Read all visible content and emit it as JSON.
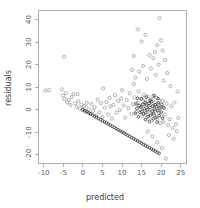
{
  "chart_data": {
    "type": "scatter",
    "title": "",
    "xlabel": "predicted",
    "ylabel": "residuals",
    "xlim": [
      -11.5,
      26.5
    ],
    "ylim": [
      -24,
      44
    ],
    "xticks": [
      -10,
      -5,
      0,
      5,
      10,
      15,
      20,
      25
    ],
    "xtick_labels": [
      "-10",
      "-5",
      "0",
      "5",
      "10",
      "15",
      "20",
      "25"
    ],
    "yticks": [
      -20,
      -10,
      0,
      10,
      20,
      30,
      40
    ],
    "ytick_labels": [
      "-20",
      "-10",
      "0",
      "10",
      "20",
      "30",
      "40"
    ],
    "grid": false,
    "legend": null,
    "marker": "open-circle",
    "marker_size": 1.6,
    "point_color": "#777777",
    "dense_point_color": "#2b2b2b",
    "axis_color": "#9a9a9a",
    "background": "#ffffff",
    "series": [
      {
        "name": "residuals",
        "points": [
          [
            -9.6,
            8.4
          ],
          [
            -8.6,
            8.6
          ],
          [
            -5.4,
            9.0
          ],
          [
            -5.1,
            6.2
          ],
          [
            -4.7,
            4.6
          ],
          [
            -4.4,
            7.3
          ],
          [
            -4.0,
            3.1
          ],
          [
            -3.6,
            4.2
          ],
          [
            -3.2,
            2.0
          ],
          [
            -2.9,
            5.6
          ],
          [
            -2.4,
            6.9
          ],
          [
            -2.0,
            2.6
          ],
          [
            -1.6,
            1.2
          ],
          [
            -1.2,
            3.6
          ],
          [
            -0.8,
            0.4
          ],
          [
            -0.4,
            2.2
          ],
          [
            -0.2,
            -0.3
          ],
          [
            0.3,
            1.6
          ],
          [
            0.6,
            -1.0
          ],
          [
            1.0,
            3.0
          ],
          [
            1.4,
            0.2
          ],
          [
            1.8,
            -1.8
          ],
          [
            2.2,
            2.4
          ],
          [
            2.6,
            -0.6
          ],
          [
            3.0,
            1.0
          ],
          [
            3.4,
            -2.6
          ],
          [
            3.8,
            4.4
          ],
          [
            4.2,
            -1.2
          ],
          [
            4.6,
            2.8
          ],
          [
            5.0,
            -3.2
          ],
          [
            5.2,
            9.4
          ],
          [
            5.6,
            0.8
          ],
          [
            6.0,
            3.4
          ],
          [
            6.4,
            -2.2
          ],
          [
            6.8,
            5.2
          ],
          [
            7.0,
            1.4
          ],
          [
            7.4,
            -4.0
          ],
          [
            7.8,
            2.0
          ],
          [
            8.2,
            6.4
          ],
          [
            8.6,
            -1.4
          ],
          [
            9.0,
            3.8
          ],
          [
            9.4,
            -0.2
          ],
          [
            9.8,
            5.0
          ],
          [
            10.0,
            8.6
          ],
          [
            10.4,
            1.8
          ],
          [
            10.8,
            -3.6
          ],
          [
            11.2,
            4.2
          ],
          [
            11.6,
            0.6
          ],
          [
            12.0,
            7.2
          ],
          [
            12.4,
            -2.0
          ],
          [
            12.8,
            2.4
          ],
          [
            13.0,
            11.4
          ],
          [
            13.2,
            5.4
          ],
          [
            13.6,
            -1.0
          ],
          [
            14.0,
            3.0
          ],
          [
            14.2,
            8.0
          ],
          [
            14.6,
            0.2
          ],
          [
            15.0,
            4.8
          ],
          [
            15.2,
            -2.8
          ],
          [
            15.4,
            2.2
          ],
          [
            15.6,
            6.6
          ],
          [
            15.8,
            -0.6
          ],
          [
            16.0,
            3.6
          ],
          [
            16.2,
            1.2
          ],
          [
            16.4,
            -3.4
          ],
          [
            16.6,
            5.8
          ],
          [
            16.8,
            0.0
          ],
          [
            17.0,
            2.8
          ],
          [
            17.2,
            -1.6
          ],
          [
            17.4,
            4.4
          ],
          [
            17.6,
            -5.0
          ],
          [
            17.8,
            1.6
          ],
          [
            18.0,
            6.0
          ],
          [
            18.2,
            -2.4
          ],
          [
            18.4,
            3.2
          ],
          [
            18.6,
            -0.4
          ],
          [
            18.8,
            5.2
          ],
          [
            19.0,
            -4.2
          ],
          [
            19.2,
            2.0
          ],
          [
            19.4,
            -1.2
          ],
          [
            19.6,
            4.0
          ],
          [
            19.8,
            -6.0
          ],
          [
            20.0,
            1.0
          ],
          [
            20.2,
            -3.0
          ],
          [
            20.4,
            3.8
          ],
          [
            20.6,
            -5.6
          ],
          [
            20.8,
            0.6
          ],
          [
            21.0,
            -2.2
          ],
          [
            21.4,
            2.6
          ],
          [
            21.8,
            -7.0
          ],
          [
            22.2,
            -4.4
          ],
          [
            22.6,
            1.4
          ],
          [
            23.0,
            -8.2
          ],
          [
            23.4,
            3.0
          ],
          [
            23.8,
            -6.6
          ],
          [
            24.2,
            8.0
          ],
          [
            24.4,
            -3.8
          ],
          [
            13.0,
            23.8
          ],
          [
            14.0,
            35.6
          ],
          [
            15.0,
            30.2
          ],
          [
            16.0,
            33.2
          ],
          [
            17.0,
            24.2
          ],
          [
            18.0,
            22.8
          ],
          [
            18.4,
            25.6
          ],
          [
            19.0,
            28.6
          ],
          [
            19.6,
            40.6
          ],
          [
            20.0,
            30.8
          ],
          [
            20.4,
            26.2
          ],
          [
            21.0,
            22.0
          ],
          [
            12.6,
            17.6
          ],
          [
            13.4,
            14.2
          ],
          [
            14.4,
            16.8
          ],
          [
            15.4,
            19.4
          ],
          [
            16.4,
            13.6
          ],
          [
            17.4,
            18.2
          ],
          [
            18.6,
            15.4
          ],
          [
            19.4,
            20.0
          ],
          [
            20.6,
            12.8
          ],
          [
            21.6,
            16.2
          ],
          [
            22.4,
            10.4
          ],
          [
            -4.8,
            23.4
          ],
          [
            -1.4,
            6.8
          ],
          [
            22.0,
            -11.4
          ],
          [
            23.2,
            -13.0
          ],
          [
            24.0,
            -9.6
          ],
          [
            21.2,
            -21.8
          ],
          [
            20.2,
            -17.2
          ],
          [
            19.0,
            -14.6
          ],
          [
            17.8,
            -12.0
          ],
          [
            16.6,
            -9.8
          ]
        ]
      },
      {
        "name": "boundary-line",
        "points": [
          [
            0.0,
            0.0
          ],
          [
            0.5,
            -0.5
          ],
          [
            1.0,
            -1.0
          ],
          [
            1.5,
            -1.5
          ],
          [
            2.0,
            -2.0
          ],
          [
            2.5,
            -2.5
          ],
          [
            3.0,
            -3.0
          ],
          [
            3.5,
            -3.5
          ],
          [
            4.0,
            -4.0
          ],
          [
            4.5,
            -4.5
          ],
          [
            5.0,
            -5.0
          ],
          [
            5.5,
            -5.5
          ],
          [
            6.0,
            -6.0
          ],
          [
            6.5,
            -6.5
          ],
          [
            7.0,
            -7.0
          ],
          [
            7.5,
            -7.5
          ],
          [
            8.0,
            -8.0
          ],
          [
            8.5,
            -8.5
          ],
          [
            9.0,
            -9.0
          ],
          [
            9.5,
            -9.5
          ],
          [
            10.0,
            -10.0
          ],
          [
            10.5,
            -10.5
          ],
          [
            11.0,
            -11.0
          ],
          [
            11.5,
            -11.5
          ],
          [
            12.0,
            -12.0
          ],
          [
            12.5,
            -12.5
          ],
          [
            13.0,
            -13.0
          ],
          [
            13.5,
            -13.5
          ],
          [
            14.0,
            -14.0
          ],
          [
            14.5,
            -14.5
          ],
          [
            15.0,
            -15.0
          ],
          [
            15.5,
            -15.5
          ],
          [
            16.0,
            -16.0
          ],
          [
            16.5,
            -16.5
          ],
          [
            17.0,
            -17.0
          ],
          [
            17.5,
            -17.5
          ],
          [
            18.0,
            -18.0
          ],
          [
            18.5,
            -18.5
          ],
          [
            19.0,
            -19.0
          ],
          [
            19.5,
            -19.5
          ]
        ]
      },
      {
        "name": "core-cluster",
        "points": [
          [
            14.8,
            1.1
          ],
          [
            15.1,
            -0.9
          ],
          [
            15.3,
            2.3
          ],
          [
            15.5,
            -2.1
          ],
          [
            15.7,
            0.3
          ],
          [
            15.9,
            3.1
          ],
          [
            16.1,
            -1.5
          ],
          [
            16.3,
            1.9
          ],
          [
            16.5,
            -0.1
          ],
          [
            16.7,
            -3.1
          ],
          [
            16.9,
            2.7
          ],
          [
            17.1,
            0.9
          ],
          [
            17.3,
            -2.5
          ],
          [
            17.5,
            3.5
          ],
          [
            17.7,
            -0.7
          ],
          [
            17.9,
            1.5
          ],
          [
            18.1,
            -1.9
          ],
          [
            18.3,
            0.1
          ],
          [
            18.5,
            2.1
          ],
          [
            18.7,
            -3.5
          ],
          [
            18.9,
            1.3
          ],
          [
            19.1,
            -0.5
          ],
          [
            19.3,
            2.9
          ],
          [
            19.5,
            -2.7
          ],
          [
            19.7,
            0.7
          ],
          [
            14.6,
            -1.3
          ],
          [
            14.4,
            1.7
          ],
          [
            14.2,
            -3.3
          ],
          [
            16.0,
            -4.5
          ],
          [
            17.0,
            -5.3
          ],
          [
            18.0,
            -4.1
          ],
          [
            19.0,
            -5.7
          ],
          [
            15.0,
            4.7
          ],
          [
            16.2,
            5.5
          ],
          [
            17.2,
            4.1
          ],
          [
            18.2,
            6.2
          ],
          [
            19.2,
            4.9
          ],
          [
            13.8,
            0.5
          ],
          [
            13.6,
            2.5
          ],
          [
            20.0,
            -1.1
          ],
          [
            20.2,
            2.2
          ],
          [
            20.4,
            -3.9
          ],
          [
            13.4,
            -1.7
          ],
          [
            14.0,
            5.0
          ],
          [
            20.6,
            0.9
          ]
        ]
      }
    ]
  },
  "axes": {
    "x_axis_name": "x-axis",
    "y_axis_name": "y-axis"
  }
}
